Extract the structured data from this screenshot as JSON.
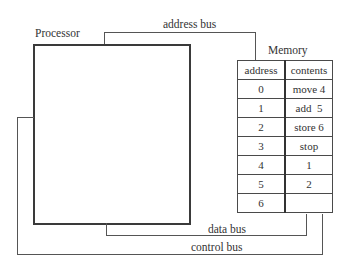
{
  "diagram": {
    "processor_label": "Processor",
    "memory_label": "Memory",
    "buses": {
      "address": "address bus",
      "data": "data bus",
      "control": "control bus"
    },
    "memory_table": {
      "headers": [
        "address",
        "contents"
      ],
      "rows": [
        {
          "address": "0",
          "contents": "move 4"
        },
        {
          "address": "1",
          "contents": "add  5"
        },
        {
          "address": "2",
          "contents": "store 6"
        },
        {
          "address": "3",
          "contents": "stop"
        },
        {
          "address": "4",
          "contents": "1"
        },
        {
          "address": "5",
          "contents": "2"
        },
        {
          "address": "6",
          "contents": ""
        }
      ]
    }
  }
}
